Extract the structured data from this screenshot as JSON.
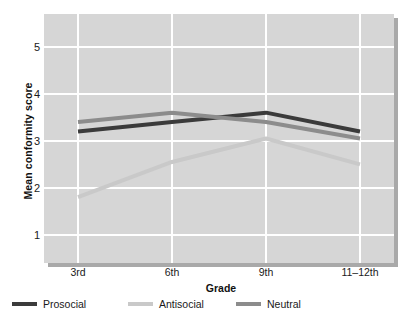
{
  "chart_data": {
    "type": "line",
    "title": "",
    "xlabel": "Grade",
    "ylabel": "Mean conformity score",
    "categories": [
      "3rd",
      "6th",
      "9th",
      "11–12th"
    ],
    "xtick_labels": [
      "3rd",
      "6th",
      "9th",
      "11–12th"
    ],
    "ytick_labels": [
      "1",
      "2",
      "3",
      "4",
      "5"
    ],
    "ytick_values": [
      1,
      2,
      3,
      4,
      5
    ],
    "ylim": [
      0.4,
      5.7
    ],
    "grid": true,
    "legend_position": "below",
    "series": [
      {
        "name": "Prosocial",
        "color": "#3b3b3b",
        "values": [
          3.2,
          3.4,
          3.6,
          3.2
        ]
      },
      {
        "name": "Antisocial",
        "color": "#c9c9c9",
        "values": [
          1.8,
          2.55,
          3.05,
          2.5
        ]
      },
      {
        "name": "Neutral",
        "color": "#8c8c8c",
        "values": [
          3.4,
          3.6,
          3.4,
          3.05
        ]
      }
    ]
  },
  "legend": {
    "items": [
      {
        "label": "Prosocial",
        "color": "#3b3b3b"
      },
      {
        "label": "Antisocial",
        "color": "#c9c9c9"
      },
      {
        "label": "Neutral",
        "color": "#8c8c8c"
      }
    ]
  },
  "axes": {
    "y_title": "Mean conformity score",
    "x_title": "Grade"
  },
  "colors": {
    "plot_background": "#d6d6d6",
    "gridline": "#ffffff",
    "shadow": "#a9a9a9",
    "text": "#1a1a1a"
  },
  "source_note": ""
}
